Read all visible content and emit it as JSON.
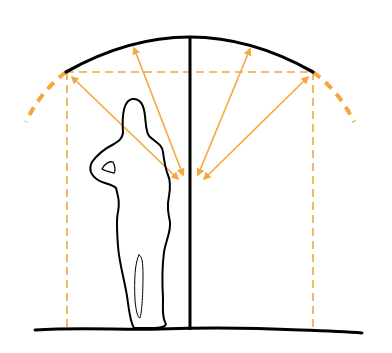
{
  "diagram": {
    "colors": {
      "structure": "#000000",
      "accent": "#f5a73c",
      "background": "#ffffff"
    },
    "arc": {
      "left": [
        66,
        72
      ],
      "apex": [
        190,
        37
      ],
      "right": [
        313,
        72
      ]
    },
    "center_post": {
      "x": 190,
      "top": 37,
      "bottom": 328
    },
    "dashed_span": {
      "y": 72,
      "x1": 66,
      "x2": 313
    },
    "dashed_verticals": [
      67,
      313
    ],
    "arrows": [
      {
        "from": [
          180,
          180
        ],
        "to": [
          70,
          75
        ]
      },
      {
        "from": [
          183,
          176
        ],
        "to": [
          133,
          46
        ]
      },
      {
        "from": [
          201,
          176
        ],
        "to": [
          250,
          48
        ]
      },
      {
        "from": [
          205,
          180
        ],
        "to": [
          310,
          76
        ]
      }
    ]
  }
}
